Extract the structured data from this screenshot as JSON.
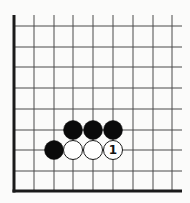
{
  "diagram": {
    "type": "go-board-corner",
    "corner": "bottom-left",
    "grid": {
      "x_lines": [
        14,
        34,
        54,
        73,
        93,
        113,
        133,
        153,
        172
      ],
      "y_lines": [
        26,
        47,
        67,
        88,
        109,
        130,
        150,
        171,
        191
      ],
      "line_top": 15,
      "line_right": 182,
      "edge_left_x": 14,
      "edge_bottom_y": 191,
      "line_color": "#4a4a4a",
      "edge_color": "#1a1a1a"
    },
    "stone_radius": 9.5,
    "colors": {
      "black_stone": "#0a0a0a",
      "white_stone_fill": "#ffffff",
      "white_stone_stroke": "#1a1a1a",
      "background": "#fbfbfa"
    },
    "stones": [
      {
        "color": "black",
        "col": 3,
        "row": 5,
        "label": ""
      },
      {
        "color": "black",
        "col": 4,
        "row": 5,
        "label": ""
      },
      {
        "color": "black",
        "col": 5,
        "row": 5,
        "label": ""
      },
      {
        "color": "black",
        "col": 2,
        "row": 6,
        "label": ""
      },
      {
        "color": "white",
        "col": 3,
        "row": 6,
        "label": ""
      },
      {
        "color": "white",
        "col": 4,
        "row": 6,
        "label": ""
      },
      {
        "color": "white",
        "col": 5,
        "row": 6,
        "label": "1"
      }
    ]
  }
}
